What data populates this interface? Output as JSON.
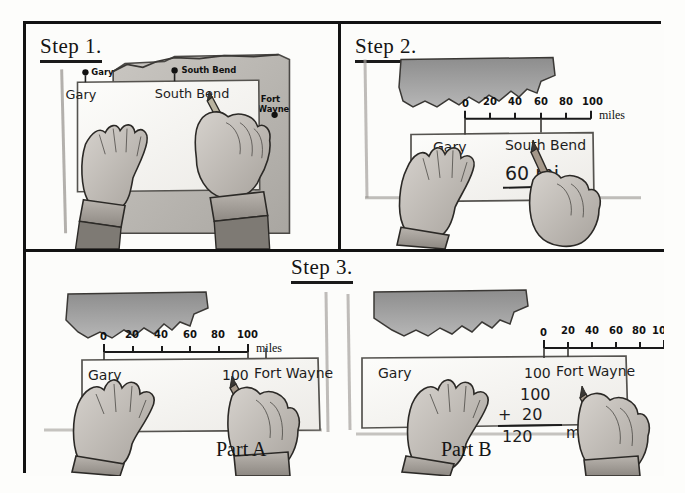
{
  "figure": {
    "border_color": "#121212",
    "paper_color": "#fcfcfa",
    "map_fill": "#9a9a9a",
    "ink_color": "#1d1d1d"
  },
  "panels": [
    {
      "id": "step1",
      "title": "Step 1.",
      "map": {
        "cities": [
          {
            "name": "Gary",
            "x": 60,
            "y": 42
          },
          {
            "name": "South Bend",
            "x": 152,
            "y": 40
          },
          {
            "name": "Fort Wayne",
            "x": 249,
            "y": 84
          }
        ]
      },
      "strip_marks": [
        {
          "label": "Gary",
          "x": 64,
          "y": 66
        },
        {
          "label": "South Bend",
          "x": 150,
          "y": 65
        }
      ],
      "hands": [
        "flat-left-hand",
        "pencil-right-hand"
      ]
    },
    {
      "id": "step2",
      "title": "Step 2.",
      "scale": {
        "ticks": [
          "0",
          "20",
          "40",
          "60",
          "80",
          "100"
        ],
        "unit_label": "miles"
      },
      "strip_marks": [
        {
          "label": "Gary",
          "x": 62,
          "y": 120
        },
        {
          "label": "South Bend",
          "x": 150,
          "y": 118
        }
      ],
      "answer": {
        "text": "60 mi.",
        "underlined": true
      },
      "hands": [
        "flat-left-hand",
        "pencil-right-hand"
      ]
    },
    {
      "id": "step3",
      "title": "Step 3.",
      "parts": [
        {
          "id": "partA",
          "label": "Part A",
          "scale": {
            "ticks": [
              "0",
              "20",
              "40",
              "60",
              "80",
              "100"
            ],
            "unit_label": "miles"
          },
          "strip_marks": [
            {
              "label": "Gary",
              "x": 40,
              "y": 76
            },
            {
              "label": "100",
              "x": 185,
              "y": 76
            },
            {
              "label": "Fort Wayne",
              "x": 215,
              "y": 74
            }
          ],
          "hands": [
            "flat-left-hand",
            "pencil-right-hand"
          ]
        },
        {
          "id": "partB",
          "label": "Part B",
          "scale": {
            "ticks": [
              "0",
              "20",
              "40",
              "60",
              "80",
              "100"
            ],
            "unit_label": ""
          },
          "strip_marks": [
            {
              "label": "Gary",
              "x": 42,
              "y": 66
            },
            {
              "label": "100",
              "x": 160,
              "y": 66
            },
            {
              "label": "Fort Wayne",
              "x": 190,
              "y": 64
            }
          ],
          "sum": {
            "addend_top": "100",
            "plus_sign": "+",
            "addend_bottom": "20",
            "total": "120",
            "unit": "mi."
          },
          "hands": [
            "flat-left-hand",
            "pencil-right-hand"
          ]
        }
      ]
    }
  ]
}
